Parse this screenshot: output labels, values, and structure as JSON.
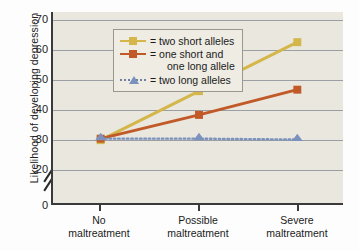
{
  "chart_data": {
    "type": "line",
    "title": "",
    "xlabel": "",
    "ylabel": "Likelihood of developing depression",
    "categories": [
      "No maltreatment",
      "Possible maltreatment",
      "Severe maltreatment"
    ],
    "category_lines": [
      [
        "No",
        "maltreatment"
      ],
      [
        "Possible",
        "maltreatment"
      ],
      [
        "Severe",
        "maltreatment"
      ]
    ],
    "ylim": [
      0.17,
      0.7
    ],
    "ytick_labels": [
      ".70",
      ".60",
      ".50",
      ".40",
      ".30",
      ".20",
      "0"
    ],
    "ytick_values": [
      0.7,
      0.6,
      0.5,
      0.4,
      0.3,
      0.2,
      0.0
    ],
    "gridlines": [
      0.7,
      0.6,
      0.5,
      0.4,
      0.3,
      0.2
    ],
    "grid": true,
    "axis_break": true,
    "legend_position": "top-left",
    "series": [
      {
        "name": "two short alleles",
        "legend_label": "= two short alleles",
        "color": "#d4b64a",
        "marker": "square",
        "linestyle": "solid",
        "values": [
          0.295,
          0.46,
          0.625
        ]
      },
      {
        "name": "one short and one long allele",
        "legend_label": "= one short and",
        "legend_label_line2": "one long allele",
        "color": "#c15a28",
        "marker": "square",
        "linestyle": "solid",
        "values": [
          0.3,
          0.38,
          0.465
        ]
      },
      {
        "name": "two long alleles",
        "legend_label": "= two long alleles",
        "color": "#7b92bd",
        "marker": "triangle",
        "linestyle": "dotted",
        "values": [
          0.3,
          0.3,
          0.297
        ]
      }
    ]
  },
  "axis": {
    "y_title": "Likelihood of developing depression"
  },
  "colors": {
    "plot_background": "#e9e7de",
    "legend_background": "#eeece3",
    "gridline": "#8d9099",
    "axis": "#3a3a3a",
    "series_short_short": "#d4b64a",
    "series_short_long": "#c15a28",
    "series_long_long": "#7b92bd"
  }
}
